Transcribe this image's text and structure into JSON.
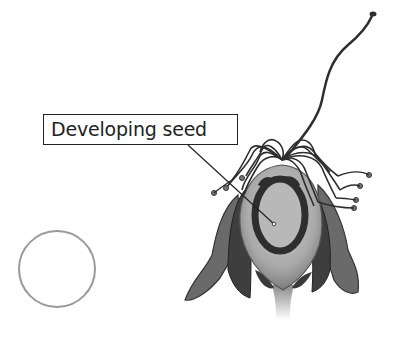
{
  "diagram": {
    "labels": [
      {
        "text": "Developing seed",
        "points_to": "ovule inside ovary"
      }
    ],
    "answer_circles": [
      {
        "shape": "circle",
        "content": ""
      }
    ],
    "colors": {
      "label_border": "#222222",
      "circle_outline": "#9a9a9a",
      "ovary_fill": "#b5b5b5",
      "dark_tissue": "#3a3a3a",
      "petals": "#6a6a6a"
    }
  }
}
